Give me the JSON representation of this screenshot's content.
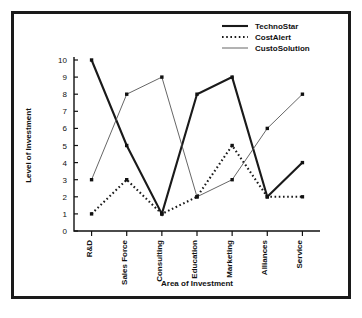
{
  "chart_data": {
    "type": "line",
    "title": "",
    "xlabel": "Area of Investment",
    "ylabel": "Level of Investment",
    "categories": [
      "R&D",
      "Sales Force",
      "Consulting",
      "Education",
      "Marketing",
      "Alliances",
      "Service"
    ],
    "yticks": [
      0,
      1,
      2,
      3,
      4,
      5,
      6,
      7,
      8,
      9,
      10
    ],
    "ylim": [
      0,
      10
    ],
    "grid": false,
    "legend_position": "top-right",
    "series": [
      {
        "name": "TechnoStar",
        "style": "solid-thick",
        "color": "#1a1a1a",
        "values": [
          10,
          5,
          1,
          8,
          9,
          2,
          4
        ]
      },
      {
        "name": "CostAlert",
        "style": "dotted",
        "color": "#1a1a1a",
        "values": [
          1,
          3,
          1,
          2,
          5,
          2,
          2
        ]
      },
      {
        "name": "CustoSolution",
        "style": "solid-thin",
        "color": "#555555",
        "values": [
          3,
          8,
          9,
          2,
          3,
          6,
          8
        ]
      }
    ]
  },
  "legend": {
    "items": [
      {
        "label": "TechnoStar"
      },
      {
        "label": "CostAlert"
      },
      {
        "label": "CustoSolution"
      }
    ]
  },
  "axes": {
    "y_title": "Level of Investment",
    "x_title": "Area of Investment",
    "y_tick_labels": [
      "10",
      "9",
      "8",
      "7",
      "6",
      "5",
      "4",
      "3",
      "2",
      "1",
      "0"
    ],
    "x_tick_labels": [
      "R&D",
      "Sales Force",
      "Consulting",
      "Education",
      "Marketing",
      "Alliances",
      "Service"
    ]
  }
}
